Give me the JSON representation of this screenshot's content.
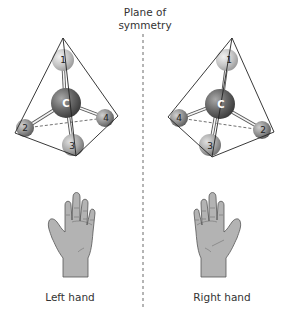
{
  "figure": {
    "title_line1": "Plane of",
    "title_line2": "symmetry",
    "left": {
      "caption": "Left hand",
      "center_label": "C",
      "atoms": [
        {
          "label": "1",
          "x": 63,
          "y": 60,
          "r": 11
        },
        {
          "label": "2",
          "x": 25,
          "y": 128,
          "r": 9
        },
        {
          "label": "3",
          "x": 73,
          "y": 145,
          "r": 11
        },
        {
          "label": "4",
          "x": 105,
          "y": 118,
          "r": 9
        }
      ]
    },
    "right": {
      "caption": "Right hand",
      "center_label": "C",
      "atoms": [
        {
          "label": "1",
          "x": 227,
          "y": 60,
          "r": 11
        },
        {
          "label": "2",
          "x": 262,
          "y": 130,
          "r": 9
        },
        {
          "label": "3",
          "x": 210,
          "y": 145,
          "r": 11
        },
        {
          "label": "4",
          "x": 179,
          "y": 118,
          "r": 9
        }
      ]
    },
    "colors": {
      "light_atom": "#c8c8c8",
      "dark_atom": "#6e6e6e",
      "mid_atom": "#8a8a8a",
      "hand_fill": "#b5b5b5",
      "hand_stroke": "#555555",
      "line": "#222222"
    }
  }
}
